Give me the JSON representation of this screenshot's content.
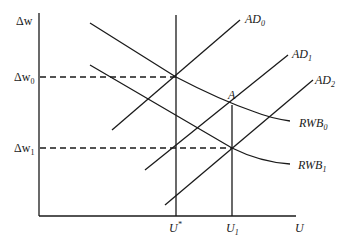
{
  "diagram": {
    "type": "economics-wage-setting-aggregate-demand",
    "axes": {
      "y_label": "Δw",
      "x_label": "U",
      "y_ticks": [
        {
          "base": "Δw",
          "sub": "0"
        },
        {
          "base": "Δw",
          "sub": "1"
        }
      ],
      "x_ticks": [
        {
          "base": "U",
          "sup": "*"
        },
        {
          "base": "U",
          "sub": "1"
        }
      ]
    },
    "curves": {
      "ad": [
        {
          "base": "AD",
          "sub": "0"
        },
        {
          "base": "AD",
          "sub": "1"
        },
        {
          "base": "AD",
          "sub": "2"
        }
      ],
      "rwb": [
        {
          "base": "RWB",
          "sub": "0"
        },
        {
          "base": "RWB",
          "sub": "1"
        }
      ]
    },
    "points": {
      "A": "A"
    }
  }
}
